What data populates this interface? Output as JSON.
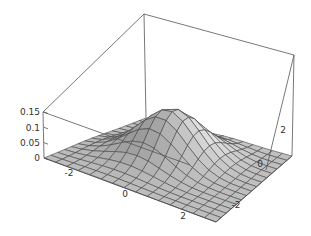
{
  "chart_data": {
    "type": "surface3d",
    "title": "",
    "x_axis": {
      "label": "",
      "range": [
        -3,
        3
      ],
      "ticks": [
        -2,
        0,
        2
      ]
    },
    "y_axis": {
      "label": "",
      "range": [
        -3,
        3
      ],
      "ticks": [
        -2,
        0,
        2
      ]
    },
    "z_axis": {
      "label": "",
      "range": [
        0,
        0.16
      ],
      "ticks": [
        0,
        0.05,
        0.1,
        0.15
      ],
      "tick_labels": [
        "0",
        "0.05",
        "0.1",
        "0.15"
      ]
    },
    "peak_value": 0.16,
    "grid": {
      "mesh_lines": 15,
      "box": true
    },
    "colors": {
      "surface": "#b8b8b8",
      "mesh": "#444444",
      "box": "#555555"
    }
  },
  "labels": {
    "z_ticks": [
      "0",
      "0.05",
      "0.1",
      "0.15"
    ],
    "front_left_ticks": [
      "-2",
      "0",
      "2"
    ],
    "front_right_ticks": [
      "-2",
      "0",
      "2"
    ]
  }
}
